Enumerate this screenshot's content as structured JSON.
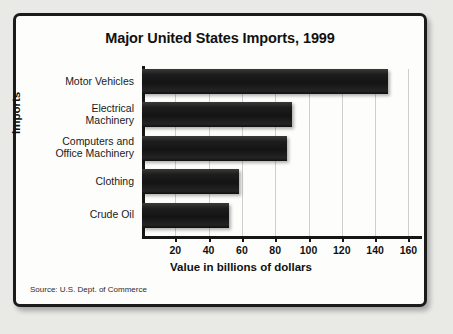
{
  "figure": {
    "title": "Major United States Imports, 1999",
    "source": "Source: U.S. Dept. of Commerce",
    "frame_color": "#1b1b1b",
    "background_color": "#fdfdfb",
    "page_background": "#e9e9e6",
    "bar_color": "#161616"
  },
  "chart_data": {
    "type": "bar",
    "orientation": "horizontal",
    "title": "Major United States Imports, 1999",
    "xlabel": "Value in billions of dollars",
    "ylabel": "Imports",
    "categories": [
      "Motor Vehicles",
      "Electrical Machinery",
      "Computers and Office Machinery",
      "Clothing",
      "Crude Oil"
    ],
    "category_lines": [
      [
        "Motor Vehicles"
      ],
      [
        "Electrical",
        "Machinery"
      ],
      [
        "Computers and",
        "Office Machinery"
      ],
      [
        "Clothing"
      ],
      [
        "Crude Oil"
      ]
    ],
    "values": [
      148,
      90,
      87,
      58,
      52
    ],
    "xlim": [
      0,
      172
    ],
    "ylim": null,
    "xticks": [
      20,
      40,
      60,
      80,
      100,
      120,
      140,
      160
    ],
    "xtick_labels": [
      "20",
      "40",
      "60",
      "80",
      "100",
      "120",
      "140",
      "160"
    ],
    "grid": "vertical",
    "legend": null,
    "units": "billions of dollars",
    "year": 1999
  }
}
